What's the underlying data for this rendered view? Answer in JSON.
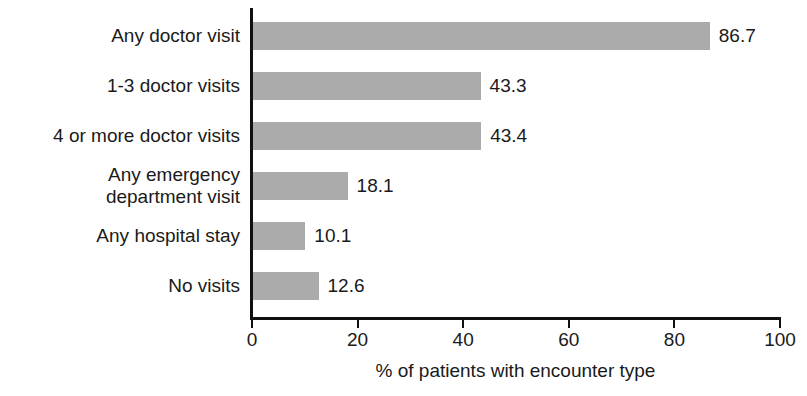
{
  "chart_data": {
    "type": "bar",
    "orientation": "horizontal",
    "title": "",
    "subtitle": "",
    "xlabel": "% of patients with encounter type",
    "ylabel": "",
    "xlim": [
      0,
      100
    ],
    "xticks": [
      "0",
      "20",
      "40",
      "60",
      "80",
      "100"
    ],
    "grid": false,
    "legend": null,
    "bar_color": "#ababab",
    "axis_color": "#111111",
    "categories": [
      "Any doctor visit",
      "1-3 doctor visits",
      "4 or more doctor visits",
      "Any emergency\ndepartment visit",
      "Any hospital stay",
      "No visits"
    ],
    "values": [
      86.7,
      43.3,
      43.4,
      18.1,
      10.1,
      12.6
    ],
    "value_labels": [
      "86.7",
      "43.3",
      "43.4",
      "18.1",
      "10.1",
      "12.6"
    ]
  }
}
